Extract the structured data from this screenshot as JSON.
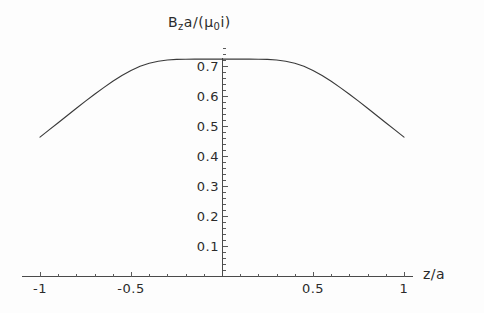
{
  "chart_data": {
    "type": "line",
    "title": "",
    "xlabel": "z/a",
    "ylabel": "B_z a/(mu_0 i)",
    "ylabel_parts": {
      "b": "B",
      "b_sub": "z",
      "a": "a/(",
      "mu": "μ",
      "mu_sub": "0",
      "i": "i)"
    },
    "xlim": [
      -1.06,
      1.06
    ],
    "ylim": [
      0.0,
      0.79
    ],
    "grid": false,
    "legend": null,
    "x_ticks": [
      {
        "value": -1,
        "label": "-1"
      },
      {
        "value": -0.5,
        "label": "-0.5"
      },
      {
        "value": 0.5,
        "label": "0.5"
      },
      {
        "value": 1,
        "label": "1"
      }
    ],
    "x_minor_ticks": [
      -0.9,
      -0.8,
      -0.7,
      -0.6,
      -0.4,
      -0.3,
      -0.2,
      -0.1,
      0.1,
      0.2,
      0.3,
      0.4,
      0.6,
      0.7,
      0.8,
      0.9
    ],
    "y_ticks": [
      {
        "value": 0.1,
        "label": "0.1"
      },
      {
        "value": 0.2,
        "label": "0.2"
      },
      {
        "value": 0.3,
        "label": "0.3"
      },
      {
        "value": 0.4,
        "label": "0.4"
      },
      {
        "value": 0.5,
        "label": "0.5"
      },
      {
        "value": 0.6,
        "label": "0.6"
      },
      {
        "value": 0.7,
        "label": "0.7"
      }
    ],
    "y_minor_ticks": [
      0.02,
      0.04,
      0.06,
      0.08,
      0.12,
      0.14,
      0.16,
      0.18,
      0.22,
      0.24,
      0.26,
      0.28,
      0.32,
      0.34,
      0.36,
      0.38,
      0.42,
      0.44,
      0.46,
      0.48,
      0.52,
      0.54,
      0.56,
      0.58,
      0.62,
      0.64,
      0.66,
      0.68,
      0.72,
      0.74,
      0.76
    ],
    "series": [
      {
        "name": "axial field",
        "color": "#3a3a3a",
        "x": [
          -1.0,
          -0.95,
          -0.9,
          -0.85,
          -0.8,
          -0.75,
          -0.7,
          -0.65,
          -0.6,
          -0.55,
          -0.5,
          -0.45,
          -0.4,
          -0.35,
          -0.3,
          -0.25,
          -0.2,
          -0.15,
          -0.1,
          -0.05,
          0.0,
          0.05,
          0.1,
          0.15,
          0.2,
          0.25,
          0.3,
          0.35,
          0.4,
          0.45,
          0.5,
          0.55,
          0.6,
          0.65,
          0.7,
          0.75,
          0.8,
          0.85,
          0.9,
          0.95,
          1.0
        ],
        "y": [
          0.463,
          0.487,
          0.511,
          0.535,
          0.559,
          0.583,
          0.606,
          0.628,
          0.649,
          0.668,
          0.685,
          0.699,
          0.709,
          0.716,
          0.72,
          0.722,
          0.7225,
          0.7228,
          0.723,
          0.7231,
          0.7231,
          0.7231,
          0.723,
          0.7228,
          0.7225,
          0.722,
          0.72,
          0.716,
          0.709,
          0.699,
          0.685,
          0.668,
          0.649,
          0.628,
          0.606,
          0.583,
          0.559,
          0.535,
          0.511,
          0.487,
          0.463
        ]
      }
    ]
  },
  "geometry": {
    "x_pixel_at_zero": 222,
    "y_pixel_at_zero": 276,
    "pixels_per_x_unit": 182,
    "pixels_per_y_unit": 300
  }
}
